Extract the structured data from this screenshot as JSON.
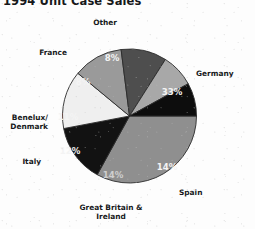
{
  "chart": {
    "title": "1994 Unit Case Sales",
    "title_clipped": true
  },
  "chart_data": {
    "type": "pie",
    "title": "1994 Unit Case Sales",
    "xlabel": "",
    "ylabel": "",
    "value_unit": "percent",
    "legend_position": "callout-labels",
    "grid": false,
    "start_angle_deg": 0,
    "direction": "clockwise",
    "categories": [
      "Germany",
      "Spain",
      "Great Britain & Ireland",
      "Italy",
      "Benelux/ Denmark",
      "France",
      "Other"
    ],
    "values": [
      33,
      14,
      14,
      12,
      11,
      8,
      8
    ],
    "labels": [
      "33%",
      "14%",
      "14%",
      "12%",
      "11%",
      "8%",
      "8%"
    ],
    "colors": [
      "#8f8f8f",
      "#121212",
      "#efefef",
      "#9a9a9a",
      "#4e4e4e",
      "#a8a8a8",
      "#0d0d0d"
    ],
    "slices": [
      {
        "name": "Germany",
        "label": "Germany",
        "value": 33,
        "pct_label": "33%",
        "color": "#8f8f8f",
        "pct_tone": "on-dark",
        "cat_x": 196,
        "cat_y": 69,
        "cat_align": "right",
        "pct_x": 172,
        "pct_y": 92
      },
      {
        "name": "Spain",
        "label": "Spain",
        "value": 14,
        "pct_label": "14%",
        "color": "#121212",
        "pct_tone": "on-dark",
        "cat_x": 179,
        "cat_y": 188,
        "cat_align": "right",
        "pct_x": 167,
        "pct_y": 167
      },
      {
        "name": "Great Britain & Ireland",
        "label": "Great Britain &\nIreland",
        "value": 14,
        "pct_label": "14%",
        "color": "#efefef",
        "pct_tone": "faint",
        "cat_x": 111,
        "cat_y": 203,
        "cat_align": "center",
        "pct_x": 113,
        "pct_y": 175
      },
      {
        "name": "Italy",
        "label": "Italy",
        "value": 12,
        "pct_label": "12%",
        "color": "#9a9a9a",
        "pct_tone": "on-dark",
        "cat_x": 41,
        "cat_y": 157,
        "cat_align": "left",
        "pct_x": 70,
        "pct_y": 151
      },
      {
        "name": "Benelux/ Denmark",
        "label": "Benelux/\nDenmark",
        "value": 11,
        "pct_label": "11%",
        "color": "#4e4e4e",
        "pct_tone": "on-dark",
        "cat_x": 48,
        "cat_y": 113,
        "cat_align": "left",
        "pct_x": 68,
        "pct_y": 117
      },
      {
        "name": "France",
        "label": "France",
        "value": 8,
        "pct_label": "8%",
        "color": "#a8a8a8",
        "pct_tone": "on-dark",
        "cat_x": 67,
        "cat_y": 48,
        "cat_align": "left",
        "pct_x": 83,
        "pct_y": 82
      },
      {
        "name": "Other",
        "label": "Other",
        "value": 8,
        "pct_label": "8%",
        "color": "#0d0d0d",
        "pct_tone": "on-dark",
        "cat_x": 105,
        "cat_y": 18,
        "cat_align": "center",
        "pct_x": 112,
        "pct_y": 58
      }
    ],
    "geometry": {
      "cx": 129.5,
      "cy": 116,
      "r": 67
    }
  }
}
